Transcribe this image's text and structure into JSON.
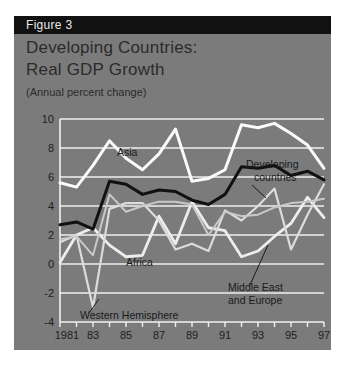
{
  "figure": {
    "header_label": "Figure 3",
    "title_line1": "Developing Countries:",
    "title_line2": "Real GDP Growth",
    "subtitle": "(Annual percent change)"
  },
  "colors": {
    "panel_background": "#7b7b7b",
    "header_background": "#111111",
    "header_text": "#e9e9e9",
    "title_text": "#2b2b2b",
    "gridline": "#efefef",
    "asia_line": "#fbfbfb",
    "developing_countries_line": "#111111",
    "africa_line": "#c9c9c9",
    "western_hemisphere_line": "#dcdcdc",
    "middle_east_line": "#ededed"
  },
  "annotations": [
    {
      "name": "asia",
      "text": "Asia",
      "x": 103,
      "y": 140
    },
    {
      "name": "developing-countries-1",
      "text": "Developing",
      "x": 232,
      "y": 152
    },
    {
      "name": "developing-countries-2",
      "text": "countries",
      "x": 240,
      "y": 165
    },
    {
      "name": "africa",
      "text": "Africa",
      "x": 112,
      "y": 250
    },
    {
      "name": "middle-east-1",
      "text": "Middle East",
      "x": 214,
      "y": 275
    },
    {
      "name": "middle-east-2",
      "text": "and Europe",
      "x": 214,
      "y": 288
    },
    {
      "name": "western-hemisphere",
      "text": "Western Hemisphere",
      "x": 66,
      "y": 303
    }
  ],
  "chart_data": {
    "type": "line",
    "title": "Developing Countries: Real GDP Growth",
    "subtitle": "(Annual percent change)",
    "xlabel": "",
    "ylabel": "Annual percent change",
    "grid": true,
    "legend": "inline-annotations",
    "x": [
      1981,
      1982,
      1983,
      1984,
      1985,
      1986,
      1987,
      1988,
      1989,
      1990,
      1991,
      1992,
      1993,
      1994,
      1995,
      1996,
      1997
    ],
    "xticklabels": [
      "1981",
      "",
      "83",
      "",
      "85",
      "",
      "87",
      "",
      "89",
      "",
      "91",
      "",
      "93",
      "",
      "95",
      "",
      "97"
    ],
    "xlim": [
      1981,
      1997
    ],
    "ylim": [
      -4,
      10
    ],
    "yticks": [
      -4,
      -2,
      0,
      2,
      4,
      6,
      8,
      10
    ],
    "yticklabels": [
      "-4",
      "-2",
      "0",
      "2",
      "4",
      "6",
      "8",
      "10"
    ],
    "series": [
      {
        "name": "Asia",
        "color": "#fbfbfb",
        "width": 3.0,
        "values": [
          5.6,
          5.3,
          6.8,
          8.5,
          7.3,
          6.5,
          7.6,
          9.3,
          5.7,
          5.9,
          6.5,
          9.6,
          9.4,
          9.7,
          9.0,
          8.2,
          6.6
        ]
      },
      {
        "name": "Developing countries",
        "color": "#111111",
        "width": 3.0,
        "values": [
          2.7,
          2.9,
          2.4,
          5.7,
          5.5,
          4.8,
          5.1,
          5.0,
          4.4,
          4.1,
          4.8,
          6.7,
          6.6,
          6.8,
          6.1,
          6.4,
          5.8
        ]
      },
      {
        "name": "Africa",
        "color": "#c9c9c9",
        "width": 2.0,
        "values": [
          1.7,
          1.9,
          0.6,
          4.8,
          3.6,
          4.0,
          4.3,
          4.3,
          4.1,
          2.0,
          3.6,
          3.3,
          3.4,
          3.9,
          4.2,
          4.3,
          4.5
        ]
      },
      {
        "name": "Western Hemisphere",
        "color": "#dcdcdc",
        "width": 2.2,
        "values": [
          1.5,
          2.0,
          -3.0,
          3.8,
          4.2,
          4.2,
          3.0,
          1.0,
          1.4,
          0.9,
          3.7,
          3.0,
          4.0,
          5.2,
          1.0,
          3.4,
          5.5
        ]
      },
      {
        "name": "Middle East and Europe",
        "color": "#ededed",
        "width": 2.8,
        "values": [
          0.1,
          2.0,
          2.5,
          1.3,
          0.5,
          0.6,
          3.3,
          1.4,
          4.3,
          2.5,
          2.3,
          0.5,
          0.9,
          1.9,
          2.8,
          4.6,
          3.2
        ]
      }
    ]
  }
}
